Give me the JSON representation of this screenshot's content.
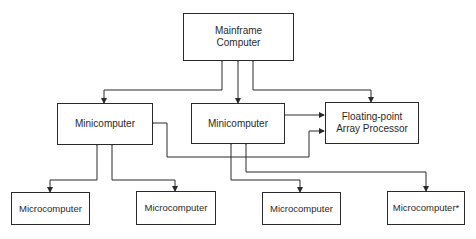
{
  "diagram": {
    "nodes": {
      "mainframe": {
        "label_line1": "Mainframe",
        "label_line2": "Computer"
      },
      "mini_left": {
        "label": "Minicomputer"
      },
      "mini_center": {
        "label": "Minicomputer"
      },
      "fp_processor": {
        "label_line1": "Floating-point",
        "label_line2": "Array Processor"
      },
      "micro_1": {
        "label": "Microcomputer"
      },
      "micro_2": {
        "label": "Microcomputer"
      },
      "micro_3": {
        "label": "Microcomputer"
      },
      "micro_4": {
        "label": "Microcomputer*"
      }
    },
    "edges": [
      {
        "from": "mini_left",
        "to": "mainframe",
        "bidirectional": true
      },
      {
        "from": "mini_center",
        "to": "mainframe",
        "bidirectional": true
      },
      {
        "from": "fp_processor",
        "to": "mainframe",
        "bidirectional": true
      },
      {
        "from": "mini_center",
        "to": "fp_processor",
        "bidirectional": false
      },
      {
        "from": "mini_left",
        "to": "fp_processor",
        "bidirectional": true
      },
      {
        "from": "micro_1",
        "to": "mini_left",
        "bidirectional": true
      },
      {
        "from": "micro_2",
        "to": "mini_left",
        "bidirectional": true
      },
      {
        "from": "micro_3",
        "to": "mini_center",
        "bidirectional": true
      },
      {
        "from": "micro_4",
        "to": "mini_center",
        "bidirectional": true
      }
    ],
    "colors": {
      "line": "#2a2a2a",
      "background": "#ffffff"
    }
  }
}
